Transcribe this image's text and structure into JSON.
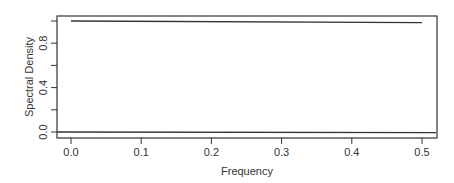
{
  "chart_data": {
    "type": "line",
    "title": "",
    "xlabel": "Frequency",
    "ylabel": "Spectral Density",
    "xlim": [
      -0.02,
      0.52
    ],
    "ylim": [
      -0.02,
      1.03
    ],
    "x_ticks": [
      0.0,
      0.1,
      0.2,
      0.3,
      0.4,
      0.5
    ],
    "x_tick_labels": [
      "0.0",
      "0.1",
      "0.2",
      "0.3",
      "0.4",
      "0.5"
    ],
    "y_ticks": [
      0.0,
      0.2,
      0.4,
      0.6,
      0.8,
      1.0
    ],
    "y_tick_labels": [
      "0.0",
      "0.4",
      "0.8"
    ],
    "y_labeled_ticks": [
      0.0,
      0.4,
      0.8
    ],
    "grid": false,
    "legend": null,
    "series": [
      {
        "name": "spectral density",
        "x": [
          0.0,
          0.5
        ],
        "y": [
          1.0,
          0.985
        ],
        "color": "#333333"
      },
      {
        "name": "zero baseline",
        "x": [
          -0.02,
          0.52
        ],
        "y": [
          0.0,
          -0.005
        ],
        "color": "#333333"
      }
    ]
  },
  "colors": {
    "axis": "#333333",
    "line": "#444444",
    "background": "#ffffff"
  }
}
